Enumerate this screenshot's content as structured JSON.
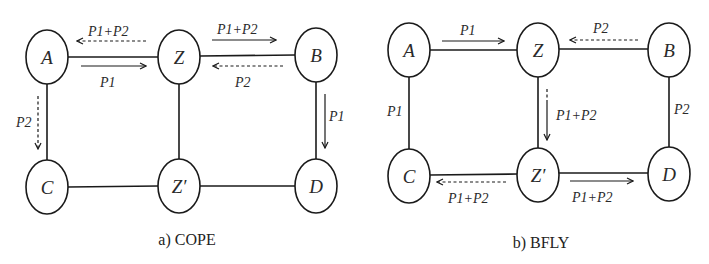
{
  "figure": {
    "panels": [
      {
        "id": "a",
        "caption": "a) COPE",
        "nodes": {
          "A": {
            "label": "A",
            "cx": 47,
            "cy": 57
          },
          "Z": {
            "label": "Z",
            "cx": 179,
            "cy": 57
          },
          "B": {
            "label": "B",
            "cx": 316,
            "cy": 55
          },
          "C": {
            "label": "C",
            "cx": 47,
            "cy": 187
          },
          "Zp": {
            "label": "Z′",
            "cx": 179,
            "cy": 186
          },
          "D": {
            "label": "D",
            "cx": 316,
            "cy": 186
          }
        },
        "edges": [
          [
            "A",
            "Z"
          ],
          [
            "Z",
            "B"
          ],
          [
            "A",
            "C"
          ],
          [
            "Z",
            "Zp"
          ],
          [
            "B",
            "D"
          ],
          [
            "C",
            "Zp"
          ],
          [
            "Zp",
            "D"
          ]
        ],
        "flows": [
          {
            "from": "Z",
            "to": "A",
            "label": "P1+P2",
            "style": "dashed"
          },
          {
            "from": "A",
            "to": "Z",
            "label": "P1",
            "style": "solid"
          },
          {
            "from": "Z",
            "to": "B",
            "label": "P1+P2",
            "style": "solid"
          },
          {
            "from": "B",
            "to": "Z",
            "label": "P2",
            "style": "dashed"
          },
          {
            "from": "A",
            "to": "C",
            "label": "P2",
            "style": "dashed"
          },
          {
            "from": "B",
            "to": "D",
            "label": "P1",
            "style": "solid"
          }
        ]
      },
      {
        "id": "b",
        "caption": "b) BFLY",
        "nodes": {
          "A": {
            "label": "A",
            "cx": 409,
            "cy": 50
          },
          "Z": {
            "label": "Z",
            "cx": 538,
            "cy": 50
          },
          "B": {
            "label": "B",
            "cx": 669,
            "cy": 50
          },
          "C": {
            "label": "C",
            "cx": 409,
            "cy": 176
          },
          "Zp": {
            "label": "Z′",
            "cx": 538,
            "cy": 176
          },
          "D": {
            "label": "D",
            "cx": 669,
            "cy": 176
          }
        },
        "edges": [
          [
            "A",
            "Z"
          ],
          [
            "Z",
            "B"
          ],
          [
            "A",
            "C"
          ],
          [
            "Z",
            "Zp"
          ],
          [
            "B",
            "D"
          ],
          [
            "C",
            "Zp"
          ],
          [
            "Zp",
            "D"
          ]
        ],
        "flows": [
          {
            "from": "A",
            "to": "Z",
            "label": "P1",
            "style": "solid"
          },
          {
            "from": "B",
            "to": "Z",
            "label": "P2",
            "style": "dashed"
          },
          {
            "from": "A",
            "to": "C",
            "label": "P1",
            "style": "edge-label"
          },
          {
            "from": "B",
            "to": "D",
            "label": "P2",
            "style": "edge-label"
          },
          {
            "from": "Z",
            "to": "Zp",
            "label": "P1+P2",
            "style": "solid-with-dashed-start"
          },
          {
            "from": "Zp",
            "to": "C",
            "label": "P1+P2",
            "style": "dashed"
          },
          {
            "from": "Zp",
            "to": "D",
            "label": "P1+P2",
            "style": "solid"
          }
        ]
      }
    ]
  }
}
